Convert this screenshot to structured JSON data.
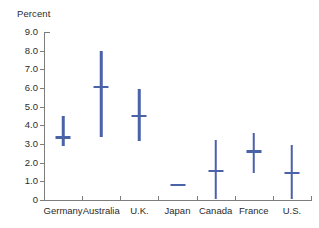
{
  "chart_data": {
    "type": "range-bar",
    "title": "",
    "subtitle": "",
    "xlabel": "",
    "ylabel": "Percent",
    "ylim": [
      0,
      9.0
    ],
    "ytick_labels": [
      "9.0",
      "8.0",
      "7.0",
      "6.0",
      "5.0",
      "4.0",
      "3.0",
      "2.0",
      "1.0",
      "0"
    ],
    "ytick_values": [
      9.0,
      8.0,
      7.0,
      6.0,
      5.0,
      4.0,
      3.0,
      2.0,
      1.0,
      0
    ],
    "grid": false,
    "legend": "none",
    "series_color": "#4a62a8",
    "axis_color": "#7d7d7d",
    "text_color": "#2b2b2b",
    "categories": [
      "Germany",
      "Australia",
      "U.K.",
      "Japan",
      "Canada",
      "France",
      "U.S."
    ],
    "points": [
      {
        "category": "Germany",
        "low": 2.9,
        "mid": 3.35,
        "high": 4.5
      },
      {
        "category": "Australia",
        "low": 3.4,
        "mid": 6.05,
        "high": 8.0
      },
      {
        "category": "U.K.",
        "low": 3.15,
        "mid": 4.5,
        "high": 5.95
      },
      {
        "category": "Japan",
        "low": 0.8,
        "mid": 0.8,
        "high": 0.8
      },
      {
        "category": "Canada",
        "low": 0.05,
        "mid": 1.55,
        "high": 3.2
      },
      {
        "category": "France",
        "low": 1.45,
        "mid": 2.6,
        "high": 3.6
      },
      {
        "category": "U.S.",
        "low": 0.05,
        "mid": 1.45,
        "high": 2.95
      }
    ]
  }
}
